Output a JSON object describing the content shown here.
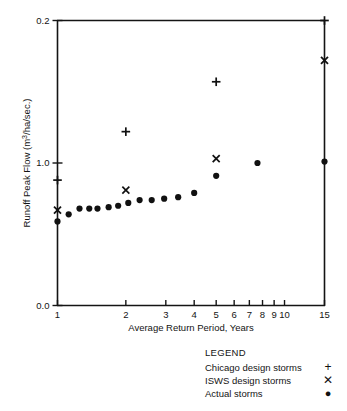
{
  "chart_data": {
    "type": "scatter",
    "title": "",
    "xlabel": "Average Return Period, Years",
    "ylabel": "Runoff Peak Flow (m³/ha/sec.)",
    "xscale": "log",
    "xlim": [
      1,
      15
    ],
    "ylim": [
      0.0,
      0.2
    ],
    "xticks": [
      1,
      2,
      3,
      4,
      5,
      6,
      7,
      8,
      9,
      10,
      15
    ],
    "xticklabels": [
      "1",
      "2",
      "3",
      "4",
      "5",
      "6",
      "7",
      "8",
      "9",
      "10",
      "15"
    ],
    "yticks": [
      0.0,
      1.0,
      0.2
    ],
    "yticklabels": [
      "0.0",
      "1.0",
      "0.2"
    ],
    "grid": false,
    "legend_position": "below-right",
    "series": [
      {
        "name": "Chicago design storms",
        "marker": "plus",
        "points": [
          {
            "x": 1,
            "y": 0.088
          },
          {
            "x": 2,
            "y": 0.122
          },
          {
            "x": 5,
            "y": 0.157
          },
          {
            "x": 15,
            "y": 0.2
          }
        ]
      },
      {
        "name": "ISWS design storms",
        "marker": "cross",
        "points": [
          {
            "x": 1,
            "y": 0.067
          },
          {
            "x": 2,
            "y": 0.081
          },
          {
            "x": 5,
            "y": 0.103
          },
          {
            "x": 15,
            "y": 0.172
          }
        ]
      },
      {
        "name": "Actual storms",
        "marker": "circle",
        "points": [
          {
            "x": 1.0,
            "y": 0.059
          },
          {
            "x": 1.12,
            "y": 0.064
          },
          {
            "x": 1.25,
            "y": 0.068
          },
          {
            "x": 1.38,
            "y": 0.068
          },
          {
            "x": 1.5,
            "y": 0.068
          },
          {
            "x": 1.68,
            "y": 0.069
          },
          {
            "x": 1.85,
            "y": 0.07
          },
          {
            "x": 2.05,
            "y": 0.072
          },
          {
            "x": 2.3,
            "y": 0.074
          },
          {
            "x": 2.6,
            "y": 0.074
          },
          {
            "x": 2.95,
            "y": 0.075
          },
          {
            "x": 3.4,
            "y": 0.076
          },
          {
            "x": 4.0,
            "y": 0.079
          },
          {
            "x": 5.0,
            "y": 0.091
          },
          {
            "x": 7.6,
            "y": 0.1
          },
          {
            "x": 15.0,
            "y": 0.101
          }
        ]
      }
    ]
  },
  "legend": {
    "title": "LEGEND",
    "entries": [
      {
        "label": "Chicago design storms",
        "symbol": "+"
      },
      {
        "label": "ISWS design storms",
        "symbol": "✕"
      },
      {
        "label": "Actual storms",
        "symbol": "●"
      }
    ]
  },
  "axes": {
    "y_title": "Runoff Peak Flow (m3/ha/sec.)",
    "y_title_parts": {
      "pre": "Runoff Peak Flow (m",
      "sup": "3",
      "post": "/ha/sec.)"
    },
    "x_title": "Average Return Period, Years",
    "y_labels": [
      "0.2",
      "1.0",
      "0.0"
    ],
    "x_labels": [
      "1",
      "2",
      "3",
      "4",
      "5",
      "6",
      "7",
      "8",
      "9",
      "10",
      "15"
    ]
  },
  "colors": {
    "ink": "#141414",
    "marker": "#111111",
    "background": "#ffffff"
  }
}
